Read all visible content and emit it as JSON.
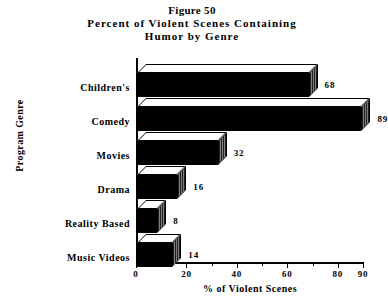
{
  "chart_data": {
    "type": "bar",
    "orientation": "horizontal",
    "title": "Figure 50",
    "subtitle_line1": "Percent of Violent Scenes Containing",
    "subtitle_line2": "Humor by Genre",
    "xlabel": "% of Violent Scenes",
    "ylabel": "Program Genre",
    "categories": [
      "Music Videos",
      "Reality Based",
      "Drama",
      "Movies",
      "Comedy",
      "Children's"
    ],
    "values": [
      14,
      8,
      16,
      32,
      89,
      68
    ],
    "data_labels": [
      "14",
      "8",
      "16",
      "32",
      "89",
      "68"
    ],
    "xlim": [
      0,
      90
    ],
    "xticks": [
      0,
      20,
      40,
      60,
      80,
      90
    ],
    "xticklabels": [
      "0",
      "20",
      "40",
      "60",
      "80",
      "90"
    ],
    "minor_xticks": [
      10,
      30,
      50,
      70
    ],
    "grid": false,
    "legend": null,
    "bar_style": {
      "three_d": true,
      "front_color": "#000000",
      "top_color": "#ffffff",
      "side_pattern": "dither-50",
      "outline_color": "#000000"
    }
  }
}
